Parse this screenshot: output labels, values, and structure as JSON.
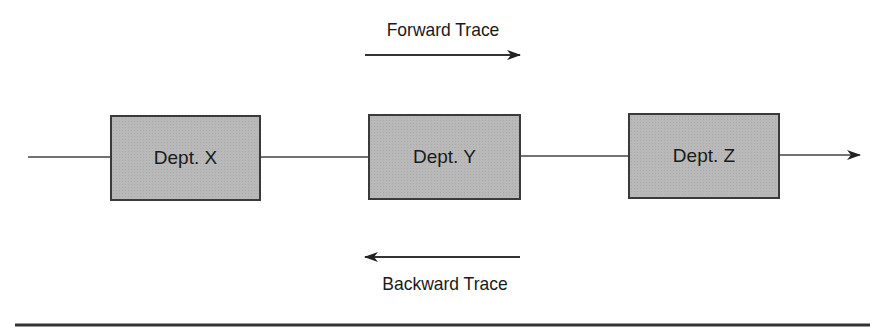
{
  "diagram": {
    "forward_trace": {
      "label": "Forward Trace",
      "direction": "left-to-right"
    },
    "backward_trace": {
      "label": "Backward Trace",
      "direction": "right-to-left"
    },
    "departments": [
      {
        "label": "Dept. X"
      },
      {
        "label": "Dept. Y"
      },
      {
        "label": "Dept. Z"
      }
    ],
    "colors": {
      "box_fill": "#b9b9b9",
      "stroke": "#3a3a3a",
      "text": "#1a1a1a"
    }
  }
}
